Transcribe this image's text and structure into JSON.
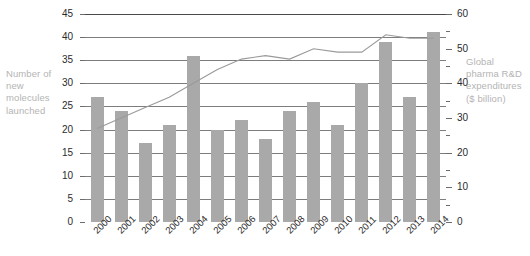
{
  "chart_data": {
    "type": "bar",
    "title": "",
    "subtitle": "",
    "categories": [
      "2000",
      "2001",
      "2002",
      "2003",
      "2004",
      "2005",
      "2006",
      "2007",
      "2008",
      "2009",
      "2010",
      "2011",
      "2012",
      "2013",
      "2014"
    ],
    "series": [
      {
        "name": "Number of new molecules launched",
        "type": "bar",
        "axis": "left",
        "values": [
          27,
          24,
          17,
          21,
          36,
          20,
          22,
          18,
          24,
          26,
          21,
          30,
          39,
          27,
          41
        ]
      },
      {
        "name": "Global pharma R&D expenditures ($ billion)",
        "type": "line",
        "axis": "right",
        "values": [
          27,
          30,
          33,
          36,
          40,
          44,
          47,
          48,
          47,
          50,
          49,
          49,
          54,
          53,
          53
        ]
      }
    ],
    "xlabel": "",
    "ylabel_left": "Number of new molecules launched",
    "ylabel_right": "Global pharma R&D expenditures ($ billion)",
    "ylim_left": [
      0,
      45
    ],
    "ylim_right": [
      0,
      60
    ],
    "ytick_left": [
      "0",
      "5",
      "10",
      "15",
      "20",
      "25",
      "30",
      "35",
      "40",
      "45"
    ],
    "ytick_right": [
      "0",
      "10",
      "20",
      "30",
      "40",
      "50",
      "60"
    ],
    "ytick_right_minor": [
      "5",
      "15",
      "25",
      "35",
      "45",
      "55"
    ],
    "grid": true,
    "legend_position": "none",
    "colors": {
      "bar": "#a9a9a9",
      "line": "#9a9a9a",
      "gridline": "#7d7d7d",
      "axis_text": "#2b2b2b",
      "caption_text": "#b4b4b4",
      "background": "#ffffff"
    }
  },
  "captions": {
    "left": "Number of new molecules launched",
    "right": "Global pharma R&D expenditures ($ billion)"
  }
}
